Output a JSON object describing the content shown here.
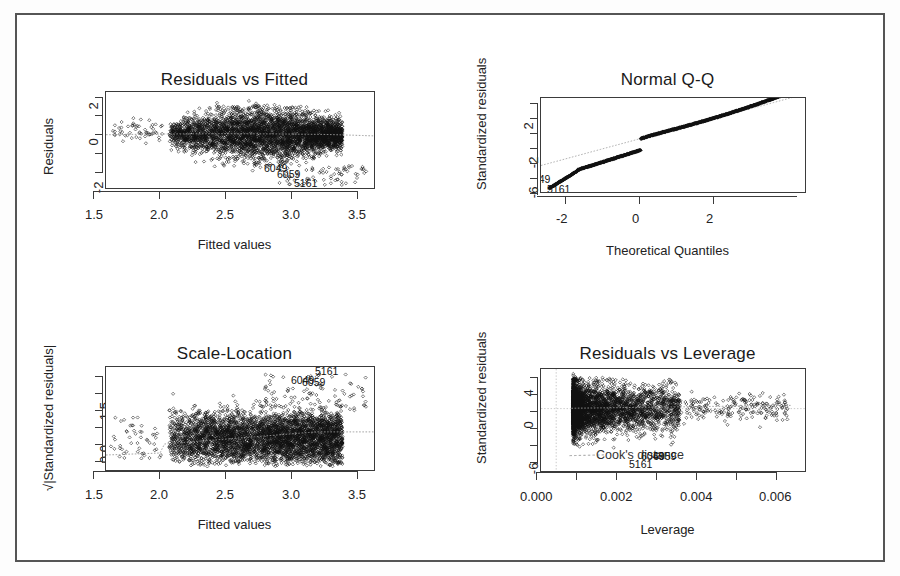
{
  "figure": {
    "kind": "r-regression-diagnostic-plots",
    "panel_count": 4,
    "border_color": "#555555",
    "marker": "open-diamond",
    "background": "#ffffff"
  },
  "chart_data": [
    {
      "id": "residuals-vs-fitted",
      "type": "scatter",
      "title": "Residuals vs Fitted",
      "xlabel": "Fitted values",
      "ylabel": "Residuals",
      "xticks": [
        "1.5",
        "2.0",
        "2.5",
        "3.0",
        "3.5"
      ],
      "xtick_values": [
        1.5,
        2.0,
        2.5,
        3.0,
        3.5
      ],
      "yticks": [
        "2",
        "0",
        "-2"
      ],
      "ytick_values": [
        2,
        0,
        -2
      ],
      "xlim": [
        1.42,
        3.68
      ],
      "ylim": [
        -3.1,
        2.35
      ],
      "grid": false,
      "legend": false,
      "smoother": "lowess",
      "reference_line_y": 0,
      "point_labels": [
        {
          "text": "6049",
          "x": 3.09,
          "y": -2.25
        },
        {
          "text": "6059",
          "x": 3.2,
          "y": -2.42
        },
        {
          "text": "5161",
          "x": 3.33,
          "y": -2.7
        }
      ],
      "n_points_approx": 6200,
      "cloud_note": "dense band centred on 0, widening from x=2.0 to x=3.3, tapering after 3.3"
    },
    {
      "id": "normal-qq",
      "type": "scatter",
      "title": "Normal Q-Q",
      "xlabel": "Theoretical Quantiles",
      "ylabel": "Standardized residuals",
      "xticks": [
        "-2",
        "0",
        "2"
      ],
      "xtick_values": [
        -2,
        0,
        2
      ],
      "yticks": [
        "2",
        "-2",
        "-6"
      ],
      "ytick_values": [
        2,
        -2,
        -6
      ],
      "xlim": [
        -4.0,
        4.0
      ],
      "ylim": [
        -7.6,
        3.6
      ],
      "grid": false,
      "legend": false,
      "reference_line": "qq-line (dotted)",
      "point_labels": [
        {
          "text": "6049",
          "x": -3.72,
          "y": -5.6
        },
        {
          "text": "5161",
          "x": -3.45,
          "y": -6.6
        }
      ],
      "n_points_approx": 6200,
      "cloud_note": "monotone S-shaped curve, heavy lower tail below theoretical -3"
    },
    {
      "id": "scale-location",
      "type": "scatter",
      "title": "Scale-Location",
      "xlabel": "Fitted values",
      "ylabel": "√|Standardized residuals|",
      "xticks": [
        "1.5",
        "2.0",
        "2.5",
        "3.0",
        "3.5"
      ],
      "xtick_values": [
        1.5,
        2.0,
        2.5,
        3.0,
        3.5
      ],
      "yticks": [
        "1.5",
        "0.0"
      ],
      "ytick_values": [
        1.5,
        0.0
      ],
      "xlim": [
        1.42,
        3.68
      ],
      "ylim": [
        -0.06,
        2.35
      ],
      "grid": false,
      "legend": false,
      "smoother": "lowess",
      "point_labels": [
        {
          "text": "5161",
          "x": 3.26,
          "y": 2.27
        },
        {
          "text": "6049",
          "x": 3.08,
          "y": 2.05
        },
        {
          "text": "6059",
          "x": 3.16,
          "y": 2.02
        }
      ],
      "n_points_approx": 6200,
      "cloud_note": "dense block between 0.0 and 1.5 with lowess trend rising slowly from 0.4 to 0.85"
    },
    {
      "id": "residuals-vs-leverage",
      "type": "scatter",
      "title": "Residuals vs Leverage",
      "xlabel": "Leverage",
      "ylabel": "Standardized residuals",
      "xticks": [
        "0.000",
        "0.002",
        "0.004",
        "0.006"
      ],
      "xtick_values": [
        0.0,
        0.002,
        0.004,
        0.006
      ],
      "yticks": [
        "4",
        "0",
        "-6"
      ],
      "ytick_values": [
        4,
        0,
        -6
      ],
      "xlim": [
        -0.0004,
        0.0066
      ],
      "ylim": [
        -7.8,
        4.8
      ],
      "grid": false,
      "legend": false,
      "smoother": "lowess",
      "reference_line_y": 0,
      "reference_line_x": 0,
      "annotation": "Cook's distance",
      "point_labels": [
        {
          "text": "6049",
          "x": 0.00235,
          "y": -6.0
        },
        {
          "text": "6059",
          "x": 0.00265,
          "y": -6.1
        },
        {
          "text": "5161",
          "x": 0.00205,
          "y": -6.7
        }
      ],
      "n_points_approx": 6200,
      "cloud_note": "dense vertical column at low leverage thinning out to scattered points near 0.006"
    }
  ]
}
